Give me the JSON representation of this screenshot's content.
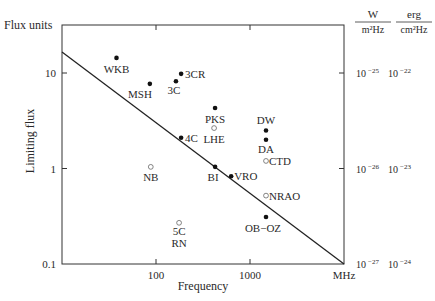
{
  "chart_data": {
    "type": "scatter",
    "title": "",
    "xlabel": "Frequency",
    "x_unit": "MHz",
    "ylabel": "Limiting flux",
    "y_unit_label": "Flux units",
    "xscale": "log",
    "yscale": "log",
    "xlim": [
      10,
      10000
    ],
    "ylim": [
      0.1,
      31
    ],
    "x_ticks": [
      {
        "value": 100,
        "label": "100"
      },
      {
        "value": 1000,
        "label": "1000"
      },
      {
        "value": 10000,
        "label": "MHz"
      }
    ],
    "y_ticks": [
      {
        "value": 10,
        "label": "10"
      },
      {
        "value": 1,
        "label": "1"
      },
      {
        "value": 0.1,
        "label": "0.1"
      }
    ],
    "right_axis": {
      "headers": [
        {
          "num": "W",
          "den": "m²Hz"
        },
        {
          "num": "erg",
          "den": "cm²Hz"
        }
      ],
      "ticks": [
        {
          "value": 10,
          "si_base": "10",
          "si_exp": "−25",
          "cgs_base": "10",
          "cgs_exp": "−22"
        },
        {
          "value": 1,
          "si_base": "10",
          "si_exp": "−26",
          "cgs_base": "10",
          "cgs_exp": "−23"
        },
        {
          "value": 0.1,
          "si_base": "10",
          "si_exp": "−27",
          "cgs_base": "10",
          "cgs_exp": "−24"
        }
      ]
    },
    "grid": false,
    "legend": null,
    "trend_line": {
      "x": [
        10,
        10000
      ],
      "y": [
        16.6,
        0.1
      ]
    },
    "series": [
      {
        "name": "filled",
        "marker": "filled-dot",
        "points": [
          {
            "label": "WKB",
            "x": 38,
            "y": 14.4,
            "lx": 0,
            "ly": 15,
            "anchor": "middle"
          },
          {
            "label": "MSH",
            "x": 86,
            "y": 7.7,
            "lx": -6,
            "ly": 14,
            "anchor": "end",
            "ldx": 8
          },
          {
            "label": "3C",
            "x": 163,
            "y": 8.2,
            "lx": -2,
            "ly": 13,
            "anchor": "middle"
          },
          {
            "label": "3CR",
            "x": 185,
            "y": 9.8,
            "lx": 4,
            "ly": 4,
            "anchor": "start"
          },
          {
            "label": "PKS",
            "x": 425,
            "y": 4.3,
            "lx": 0,
            "ly": 15,
            "anchor": "middle"
          },
          {
            "label": "4C",
            "x": 185,
            "y": 2.1,
            "lx": 4,
            "ly": 4,
            "anchor": "start"
          },
          {
            "label": "DW",
            "x": 1480,
            "y": 2.5,
            "lx": 0,
            "ly": -6,
            "anchor": "middle"
          },
          {
            "label": "DA",
            "x": 1480,
            "y": 2.0,
            "lx": 0,
            "ly": 13,
            "anchor": "middle"
          },
          {
            "label": "BI",
            "x": 425,
            "y": 1.04,
            "lx": -2,
            "ly": 14,
            "anchor": "middle"
          },
          {
            "label": "VRO",
            "x": 630,
            "y": 0.83,
            "lx": 3,
            "ly": 4,
            "anchor": "start"
          },
          {
            "label": "OB−OZ",
            "x": 1480,
            "y": 0.31,
            "lx": -3,
            "ly": 15,
            "anchor": "middle"
          }
        ]
      },
      {
        "name": "open",
        "marker": "open-circle",
        "points": [
          {
            "label": "LHE",
            "x": 415,
            "y": 2.65,
            "lx": 0,
            "ly": 15,
            "anchor": "middle"
          },
          {
            "label": "CTD",
            "x": 1480,
            "y": 1.2,
            "lx": 3,
            "ly": 4,
            "anchor": "start"
          },
          {
            "label": "NB",
            "x": 88,
            "y": 1.04,
            "lx": 0,
            "ly": 14,
            "anchor": "middle"
          },
          {
            "label": "NRAO",
            "x": 1480,
            "y": 0.52,
            "lx": 3,
            "ly": 4,
            "anchor": "start"
          },
          {
            "label": "5C",
            "x": 176,
            "y": 0.27,
            "lx": 0,
            "ly": 12,
            "anchor": "middle"
          },
          {
            "label": "RN",
            "x": 176,
            "y": 0.27,
            "lx": 0,
            "ly": 24,
            "anchor": "middle"
          }
        ]
      }
    ]
  },
  "labels": {
    "y_units": "Flux units",
    "y_title": "Limiting flux",
    "x_title": "Frequency"
  }
}
